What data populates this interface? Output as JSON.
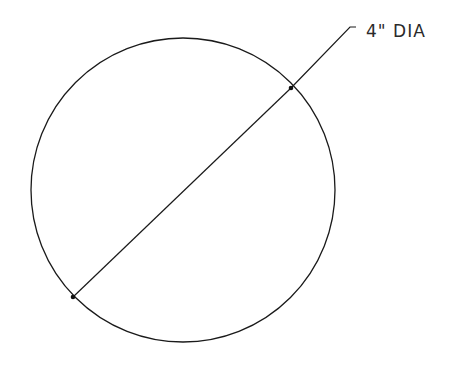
{
  "diagram": {
    "type": "circle-with-diameter-dimension",
    "circle": {
      "cx": 183,
      "cy": 190,
      "r": 152
    },
    "diameter_line": {
      "x1": 73,
      "y1": 297,
      "x2": 291,
      "y2": 88
    },
    "leader": {
      "points": "291,88 350,27 356,27"
    },
    "endpoints": [
      {
        "x": 73,
        "y": 297
      },
      {
        "x": 291,
        "y": 88
      }
    ],
    "dimension_label": "4\" DIA",
    "stroke_color": "#1a1a1a",
    "background": "#ffffff"
  }
}
